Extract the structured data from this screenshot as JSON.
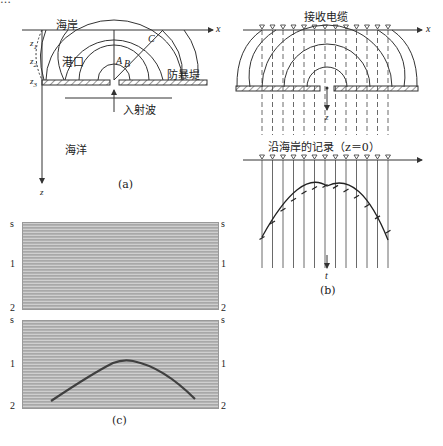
{
  "top_text": "…",
  "panel_a": {
    "caption": "(a)",
    "labels": {
      "coast": "海岸",
      "harbor": "港口",
      "breakwater": "防暴堤",
      "incident_wave": "入射波",
      "ocean": "海洋",
      "x_axis": "x",
      "z_axis": "z",
      "z1": "z",
      "z1_sub": "1",
      "z2": "z",
      "z2_sub": "2",
      "z3": "z",
      "z3_sub": "3",
      "point_a": "A",
      "point_b": "B",
      "point_c": "C"
    }
  },
  "panel_b": {
    "caption": "(b)",
    "labels": {
      "title": "接收电缆",
      "record_title": "沿海岸的记录（z＝0）",
      "x_axis": "x",
      "z_axis": "z",
      "t_axis": "t"
    },
    "receiver_count": 13
  },
  "panel_c": {
    "caption": "(c)",
    "top_section": {
      "tick_labels_left": [
        "s",
        "1",
        "2"
      ],
      "tick_labels_right": [
        "s",
        "1",
        "2"
      ]
    },
    "bottom_section": {
      "tick_labels_left": [
        "s",
        "1",
        "2"
      ],
      "tick_labels_right": [
        "s",
        "1",
        "2"
      ]
    }
  }
}
